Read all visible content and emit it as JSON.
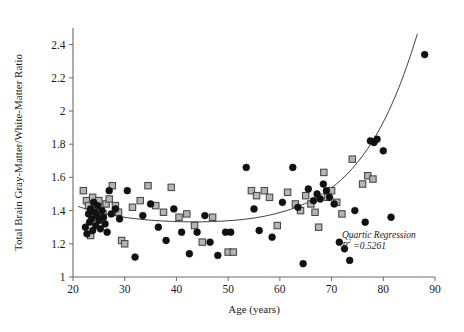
{
  "chart_data": {
    "type": "scatter",
    "title": "",
    "xlabel": "Age (years)",
    "ylabel": "Total Brain Gray-Matter/White-Matter Ratio",
    "xlim": [
      20,
      90
    ],
    "ylim": [
      1,
      2.5
    ],
    "xticks": [
      20,
      30,
      40,
      50,
      60,
      70,
      80,
      90
    ],
    "xtick_labels": [
      "20",
      "30",
      "40",
      "50",
      "60",
      "70",
      "80",
      "90"
    ],
    "yticks": [
      1,
      1.2,
      1.4,
      1.6,
      1.8,
      2,
      2.2,
      2.4
    ],
    "ytick_labels": [
      "1",
      "1.2",
      "1.4",
      "1.6",
      "1.8",
      "2",
      "2.2",
      "2.4"
    ],
    "grid": false,
    "legend": "none",
    "annotations": [
      {
        "name": "regression-annotation",
        "line1": "Quartic Regression",
        "line2_prefix": "R",
        "line2_sup": "2",
        "line2_suffix": " =0.5261",
        "x": 72,
        "y": 1.235
      }
    ],
    "marker_styles": {
      "circle": {
        "name": "filled-circle",
        "fill": "#111111",
        "stroke": "#111111",
        "radius": 3.4
      },
      "square": {
        "name": "gray-square",
        "fill": "#b5b5b5",
        "stroke": "#4a4a4a",
        "size": 6.4
      }
    },
    "series": [
      {
        "name": "Group A (circles)",
        "marker": "circle",
        "points": [
          [
            22.4,
            1.3
          ],
          [
            22.7,
            1.26
          ],
          [
            23.0,
            1.38
          ],
          [
            23.2,
            1.33
          ],
          [
            23.4,
            1.41
          ],
          [
            23.6,
            1.35
          ],
          [
            23.8,
            1.28
          ],
          [
            24.0,
            1.45
          ],
          [
            24.2,
            1.39
          ],
          [
            24.4,
            1.31
          ],
          [
            24.6,
            1.37
          ],
          [
            24.8,
            1.43
          ],
          [
            25.0,
            1.34
          ],
          [
            25.3,
            1.29
          ],
          [
            25.6,
            1.4
          ],
          [
            25.9,
            1.36
          ],
          [
            26.2,
            1.32
          ],
          [
            26.6,
            1.27
          ],
          [
            27.0,
            1.52
          ],
          [
            27.4,
            1.38
          ],
          [
            28.2,
            1.41
          ],
          [
            29.0,
            1.35
          ],
          [
            30.5,
            1.52
          ],
          [
            32.0,
            1.12
          ],
          [
            33.5,
            1.37
          ],
          [
            35.0,
            1.44
          ],
          [
            36.5,
            1.3
          ],
          [
            38.0,
            1.22
          ],
          [
            39.5,
            1.41
          ],
          [
            41.0,
            1.27
          ],
          [
            42.5,
            1.14
          ],
          [
            44.0,
            1.27
          ],
          [
            45.5,
            1.37
          ],
          [
            46.5,
            1.21
          ],
          [
            48.0,
            1.13
          ],
          [
            49.5,
            1.27
          ],
          [
            50.5,
            1.27
          ],
          [
            53.5,
            1.66
          ],
          [
            55.0,
            1.41
          ],
          [
            56.0,
            1.28
          ],
          [
            58.5,
            1.24
          ],
          [
            60.5,
            1.45
          ],
          [
            62.5,
            1.66
          ],
          [
            63.5,
            1.42
          ],
          [
            64.5,
            1.08
          ],
          [
            65.5,
            1.53
          ],
          [
            66.5,
            1.46
          ],
          [
            67.2,
            1.5
          ],
          [
            67.8,
            1.47
          ],
          [
            68.4,
            1.56
          ],
          [
            69.0,
            1.52
          ],
          [
            69.6,
            1.48
          ],
          [
            70.5,
            1.44
          ],
          [
            71.5,
            1.21
          ],
          [
            72.5,
            1.17
          ],
          [
            73.5,
            1.1
          ],
          [
            74.5,
            1.4
          ],
          [
            76.5,
            1.33
          ],
          [
            77.5,
            1.82
          ],
          [
            78.2,
            1.81
          ],
          [
            78.8,
            1.83
          ],
          [
            80.0,
            1.76
          ],
          [
            81.5,
            1.36
          ],
          [
            88.0,
            2.34
          ]
        ]
      },
      {
        "name": "Group B (squares)",
        "marker": "square",
        "points": [
          [
            22.0,
            1.52
          ],
          [
            22.6,
            1.46
          ],
          [
            23.0,
            1.43
          ],
          [
            23.4,
            1.25
          ],
          [
            23.8,
            1.48
          ],
          [
            24.2,
            1.44
          ],
          [
            24.6,
            1.4
          ],
          [
            25.0,
            1.46
          ],
          [
            25.4,
            1.42
          ],
          [
            25.8,
            1.38
          ],
          [
            26.4,
            1.44
          ],
          [
            27.0,
            1.47
          ],
          [
            27.6,
            1.55
          ],
          [
            28.2,
            1.43
          ],
          [
            28.8,
            1.39
          ],
          [
            29.4,
            1.22
          ],
          [
            30.0,
            1.2
          ],
          [
            31.5,
            1.42
          ],
          [
            33.0,
            1.46
          ],
          [
            34.5,
            1.55
          ],
          [
            36.0,
            1.43
          ],
          [
            37.5,
            1.39
          ],
          [
            39.0,
            1.54
          ],
          [
            40.5,
            1.36
          ],
          [
            42.0,
            1.38
          ],
          [
            43.5,
            1.31
          ],
          [
            45.0,
            1.21
          ],
          [
            47.0,
            1.36
          ],
          [
            50.0,
            1.15
          ],
          [
            51.0,
            1.15
          ],
          [
            54.5,
            1.52
          ],
          [
            55.5,
            1.49
          ],
          [
            57.0,
            1.52
          ],
          [
            58.0,
            1.48
          ],
          [
            59.5,
            1.31
          ],
          [
            61.5,
            1.51
          ],
          [
            63.0,
            1.44
          ],
          [
            64.0,
            1.4
          ],
          [
            65.0,
            1.49
          ],
          [
            66.0,
            1.44
          ],
          [
            66.8,
            1.39
          ],
          [
            67.5,
            1.3
          ],
          [
            68.5,
            1.63
          ],
          [
            69.2,
            1.48
          ],
          [
            70.0,
            1.52
          ],
          [
            71.0,
            1.45
          ],
          [
            72.0,
            1.38
          ],
          [
            74.0,
            1.71
          ],
          [
            76.0,
            1.56
          ],
          [
            77.0,
            1.61
          ],
          [
            78.0,
            1.59
          ]
        ]
      }
    ],
    "fit_curve": {
      "name": "quartic-regression-curve",
      "stroke": "#2b2b2b",
      "width": 0.9,
      "points": [
        [
          21.0,
          1.425
        ],
        [
          23.0,
          1.405
        ],
        [
          25.0,
          1.389
        ],
        [
          27.0,
          1.375
        ],
        [
          29.0,
          1.364
        ],
        [
          31.0,
          1.355
        ],
        [
          33.0,
          1.348
        ],
        [
          35.0,
          1.342
        ],
        [
          37.0,
          1.338
        ],
        [
          39.0,
          1.335
        ],
        [
          41.0,
          1.333
        ],
        [
          43.0,
          1.332
        ],
        [
          45.0,
          1.332
        ],
        [
          47.0,
          1.334
        ],
        [
          49.0,
          1.337
        ],
        [
          51.0,
          1.341
        ],
        [
          53.0,
          1.347
        ],
        [
          55.0,
          1.355
        ],
        [
          57.0,
          1.366
        ],
        [
          59.0,
          1.38
        ],
        [
          61.0,
          1.397
        ],
        [
          63.0,
          1.418
        ],
        [
          65.0,
          1.444
        ],
        [
          67.0,
          1.476
        ],
        [
          69.0,
          1.515
        ],
        [
          71.0,
          1.562
        ],
        [
          73.0,
          1.62
        ],
        [
          75.0,
          1.69
        ],
        [
          77.0,
          1.774
        ],
        [
          79.0,
          1.875
        ],
        [
          81.0,
          1.996
        ],
        [
          83.0,
          2.14
        ],
        [
          85.0,
          2.31
        ],
        [
          86.6,
          2.465
        ]
      ]
    }
  }
}
